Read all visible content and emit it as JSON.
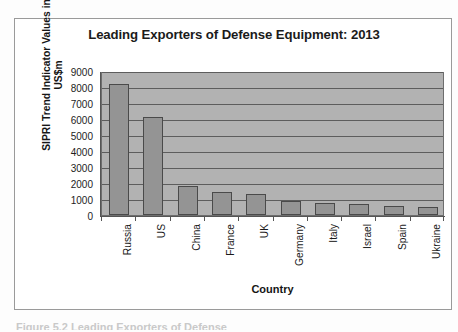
{
  "figure": {
    "caption_remnant": "Figure 5.2   Leading Exporters of Defense"
  },
  "chart_data": {
    "type": "bar",
    "title": "Leading Exporters of Defense Equipment: 2013",
    "xlabel": "Country",
    "ylabel": "SIPRI Trend Indicator Values in US$m",
    "categories": [
      "Russia",
      "US",
      "China",
      "France",
      "UK",
      "Germany",
      "Italy",
      "Israel",
      "Spain",
      "Ukraine"
    ],
    "values": [
      8200,
      6100,
      1800,
      1450,
      1300,
      900,
      720,
      680,
      560,
      480
    ],
    "ylim": [
      0,
      9000
    ],
    "yticks": [
      0,
      1000,
      2000,
      3000,
      4000,
      5000,
      6000,
      7000,
      8000,
      9000
    ],
    "ytick_labels": [
      "0",
      "1000",
      "2000",
      "3000",
      "4000",
      "5000",
      "6000",
      "7000",
      "8000",
      "9000"
    ],
    "grid": true,
    "legend": false,
    "colors": {
      "bar_fill": "#949494",
      "bar_edge": "#4a4a4a",
      "plot_background": "#b2b2b2",
      "gridline": "#5d5d5d",
      "axis": "#555555",
      "text": "#1a1a1a"
    }
  }
}
